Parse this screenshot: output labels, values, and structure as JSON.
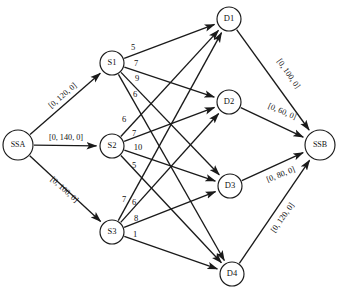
{
  "diagram": {
    "type": "directed-network-graph",
    "background_color": "#ffffff",
    "line_color": "#1a1a1a",
    "node_fill": "#ffffff"
  },
  "nodes": [
    {
      "id": "SSA",
      "label": "SSA",
      "x": 18,
      "y": 145,
      "r": 15,
      "kind": "super-source"
    },
    {
      "id": "S1",
      "label": "S1",
      "x": 112,
      "y": 63,
      "r": 12,
      "kind": "supply"
    },
    {
      "id": "S2",
      "label": "S2",
      "x": 112,
      "y": 146,
      "r": 12,
      "kind": "supply"
    },
    {
      "id": "S3",
      "label": "S3",
      "x": 112,
      "y": 232,
      "r": 12,
      "kind": "supply"
    },
    {
      "id": "D1",
      "label": "D1",
      "x": 229,
      "y": 19,
      "r": 12,
      "kind": "demand"
    },
    {
      "id": "D2",
      "label": "D2",
      "x": 229,
      "y": 102,
      "r": 12,
      "kind": "demand"
    },
    {
      "id": "D3",
      "label": "D3",
      "x": 230,
      "y": 186,
      "r": 12,
      "kind": "demand"
    },
    {
      "id": "D4",
      "label": "D4",
      "x": 232,
      "y": 274,
      "r": 12,
      "kind": "demand"
    },
    {
      "id": "SSB",
      "label": "SSB",
      "x": 320,
      "y": 145,
      "r": 15,
      "kind": "super-sink"
    }
  ],
  "source_arcs": [
    {
      "from": "SSA",
      "to": "S1",
      "label": "[0, 120, 0]",
      "label_x": 63,
      "label_y": 96,
      "rotate": -41
    },
    {
      "from": "SSA",
      "to": "S2",
      "label": "[0, 140, 0]",
      "label_x": 66,
      "label_y": 138,
      "rotate": 0
    },
    {
      "from": "SSA",
      "to": "S3",
      "label": "[0, 100, 0]",
      "label_x": 64,
      "label_y": 190,
      "rotate": 42
    }
  ],
  "sink_arcs": [
    {
      "from": "D1",
      "to": "SSB",
      "label": "[0, 100, 0]",
      "label_x": 288,
      "label_y": 74,
      "rotate": 55
    },
    {
      "from": "D2",
      "to": "SSB",
      "label": "[0, 60, 0]",
      "label_x": 282,
      "label_y": 112,
      "rotate": 23
    },
    {
      "from": "D3",
      "to": "SSB",
      "label": "[0, 80, 0]",
      "label_x": 281,
      "label_y": 175,
      "rotate": -22
    },
    {
      "from": "D4",
      "to": "SSB",
      "label": "[0, 120, 0]",
      "label_x": 283,
      "label_y": 218,
      "rotate": -55
    }
  ],
  "transport_arcs": [
    {
      "from": "S1",
      "to": "D1",
      "cost": "5",
      "label_x": 133,
      "label_y": 48
    },
    {
      "from": "S1",
      "to": "D2",
      "cost": "7",
      "label_x": 136,
      "label_y": 64
    },
    {
      "from": "S1",
      "to": "D3",
      "cost": "9",
      "label_x": 137,
      "label_y": 79
    },
    {
      "from": "S1",
      "to": "D4",
      "cost": "6",
      "label_x": 135,
      "label_y": 95
    },
    {
      "from": "S2",
      "to": "D1",
      "cost": "6",
      "label_x": 124,
      "label_y": 120
    },
    {
      "from": "S2",
      "to": "D2",
      "cost": "7",
      "label_x": 134,
      "label_y": 134
    },
    {
      "from": "S2",
      "to": "D3",
      "cost": "10",
      "label_x": 138,
      "label_y": 148
    },
    {
      "from": "S2",
      "to": "D4",
      "cost": "5",
      "label_x": 134,
      "label_y": 166
    },
    {
      "from": "S3",
      "to": "D1",
      "cost": "7",
      "label_x": 124,
      "label_y": 200
    },
    {
      "from": "S3",
      "to": "D2",
      "cost": "6",
      "label_x": 134,
      "label_y": 203
    },
    {
      "from": "S3",
      "to": "D3",
      "cost": "8",
      "label_x": 136,
      "label_y": 219
    },
    {
      "from": "S3",
      "to": "D4",
      "cost": "1",
      "label_x": 135,
      "label_y": 235
    }
  ]
}
